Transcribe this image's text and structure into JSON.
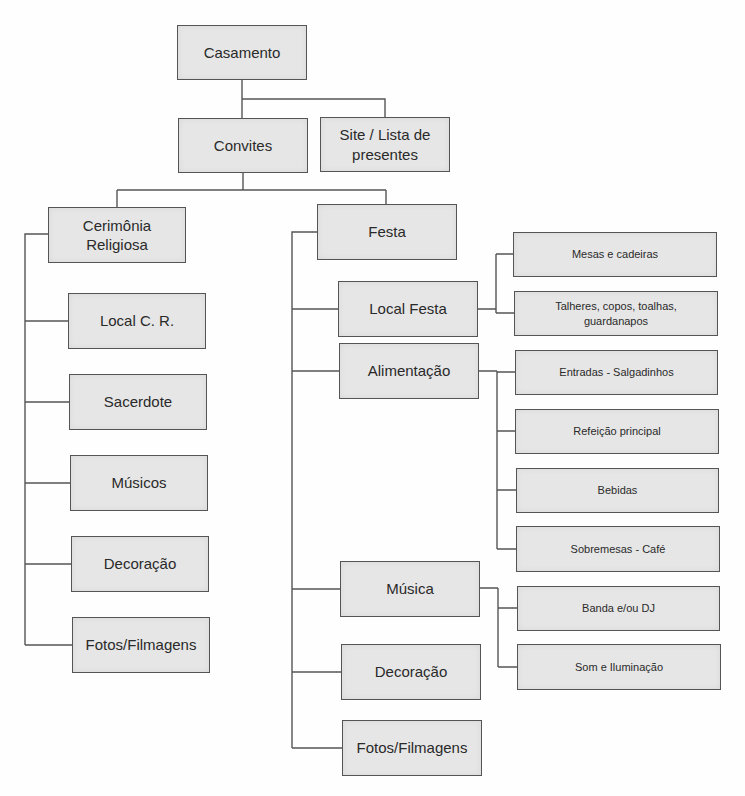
{
  "diagram": {
    "type": "tree",
    "root": "Casamento",
    "colors": {
      "box_fill": "#e6e6e6",
      "box_border": "#555555",
      "line": "#555555",
      "background": "#fefefe"
    },
    "nodes": [
      {
        "id": "casamento",
        "label": "Casamento",
        "x": 177,
        "y": 25,
        "w": 130,
        "h": 55,
        "size": "l1"
      },
      {
        "id": "convites",
        "label": "Convites",
        "x": 178,
        "y": 118,
        "w": 130,
        "h": 55,
        "size": "l1"
      },
      {
        "id": "site-lista",
        "label": "Site / Lista de\npresentes",
        "x": 320,
        "y": 117,
        "w": 130,
        "h": 55,
        "size": "l1"
      },
      {
        "id": "cerimonia",
        "label": "Cerimônia\nReligiosa",
        "x": 48,
        "y": 207,
        "w": 138,
        "h": 56,
        "size": "l1"
      },
      {
        "id": "festa",
        "label": "Festa",
        "x": 317,
        "y": 204,
        "w": 140,
        "h": 56,
        "size": "l1"
      },
      {
        "id": "local-cr",
        "label": "Local C. R.",
        "x": 68,
        "y": 293,
        "w": 138,
        "h": 56,
        "size": "l1"
      },
      {
        "id": "sacerdote",
        "label": "Sacerdote",
        "x": 69,
        "y": 374,
        "w": 138,
        "h": 56,
        "size": "l1"
      },
      {
        "id": "musicos",
        "label": "Músicos",
        "x": 70,
        "y": 455,
        "w": 138,
        "h": 56,
        "size": "l1"
      },
      {
        "id": "decoracao-cr",
        "label": "Decoração",
        "x": 71,
        "y": 536,
        "w": 138,
        "h": 56,
        "size": "l1"
      },
      {
        "id": "fotos-cr",
        "label": "Fotos/Filmagens",
        "x": 72,
        "y": 617,
        "w": 138,
        "h": 56,
        "size": "l1"
      },
      {
        "id": "local-festa",
        "label": "Local Festa",
        "x": 338,
        "y": 281,
        "w": 140,
        "h": 56,
        "size": "l1"
      },
      {
        "id": "alimentacao",
        "label": "Alimentação",
        "x": 339,
        "y": 343,
        "w": 140,
        "h": 56,
        "size": "l1"
      },
      {
        "id": "mesas",
        "label": "Mesas e cadeiras",
        "x": 513,
        "y": 232,
        "w": 204,
        "h": 45,
        "size": "l2"
      },
      {
        "id": "talheres",
        "label": "Talheres, copos, toalhas,\nguardanapos",
        "x": 514,
        "y": 291,
        "w": 204,
        "h": 45,
        "size": "l2"
      },
      {
        "id": "entradas",
        "label": "Entradas - Salgadinhos",
        "x": 515,
        "y": 350,
        "w": 203,
        "h": 45,
        "size": "l2"
      },
      {
        "id": "refeicao",
        "label": "Refeição principal",
        "x": 515,
        "y": 409,
        "w": 204,
        "h": 45,
        "size": "l2"
      },
      {
        "id": "bebidas",
        "label": "Bebidas",
        "x": 516,
        "y": 468,
        "w": 203,
        "h": 45,
        "size": "l2"
      },
      {
        "id": "sobremesas",
        "label": "Sobremesas - Café",
        "x": 516,
        "y": 526,
        "w": 204,
        "h": 46,
        "size": "l2"
      },
      {
        "id": "musica",
        "label": "Música",
        "x": 340,
        "y": 561,
        "w": 140,
        "h": 56,
        "size": "l1"
      },
      {
        "id": "banda",
        "label": "Banda e/ou DJ",
        "x": 517,
        "y": 586,
        "w": 203,
        "h": 45,
        "size": "l2"
      },
      {
        "id": "som",
        "label": "Som e Iluminação",
        "x": 517,
        "y": 644,
        "w": 204,
        "h": 46,
        "size": "l2"
      },
      {
        "id": "decoracao-festa",
        "label": "Decoração",
        "x": 341,
        "y": 644,
        "w": 140,
        "h": 56,
        "size": "l1"
      },
      {
        "id": "fotos-festa",
        "label": "Fotos/Filmagens",
        "x": 342,
        "y": 720,
        "w": 140,
        "h": 56,
        "size": "l1"
      }
    ],
    "edges": [
      {
        "from": "casamento",
        "to": "convites"
      },
      {
        "from": "casamento",
        "to": "site-lista"
      },
      {
        "from": "convites",
        "to": "cerimonia"
      },
      {
        "from": "convites",
        "to": "festa"
      },
      {
        "from": "cerimonia",
        "to": "local-cr"
      },
      {
        "from": "cerimonia",
        "to": "sacerdote"
      },
      {
        "from": "cerimonia",
        "to": "musicos"
      },
      {
        "from": "cerimonia",
        "to": "decoracao-cr"
      },
      {
        "from": "cerimonia",
        "to": "fotos-cr"
      },
      {
        "from": "festa",
        "to": "local-festa"
      },
      {
        "from": "festa",
        "to": "alimentacao"
      },
      {
        "from": "festa",
        "to": "musica"
      },
      {
        "from": "festa",
        "to": "decoracao-festa"
      },
      {
        "from": "festa",
        "to": "fotos-festa"
      },
      {
        "from": "local-festa",
        "to": "mesas"
      },
      {
        "from": "local-festa",
        "to": "talheres"
      },
      {
        "from": "alimentacao",
        "to": "entradas"
      },
      {
        "from": "alimentacao",
        "to": "refeicao"
      },
      {
        "from": "alimentacao",
        "to": "bebidas"
      },
      {
        "from": "alimentacao",
        "to": "sobremesas"
      },
      {
        "from": "musica",
        "to": "banda"
      },
      {
        "from": "musica",
        "to": "som"
      }
    ],
    "connectors": [
      "M242 80 V118",
      "M242 99 H385 V117",
      "M243 173 V190 M117 190 H386 M117 190 V207 M386 190 V204",
      "M48 234 H25 V645 M25 321 H68 M25 402 H69 M25 483 H70 M25 564 H71 M25 645 H72",
      "M317 232 H292 V748 M292 309 H338 M292 371 H339 M292 589 H340 M292 672 H341 M292 748 H342",
      "M478 309 H496 M496 254 V313 M496 254 H513 M496 313 H514",
      "M479 371 H497 M497 371 V549 M497 372 H515 M497 431 H515 M497 490 H516 M497 549 H516",
      "M480 588 H498 M498 588 V667 M498 608 H517 M498 667 H517"
    ]
  }
}
